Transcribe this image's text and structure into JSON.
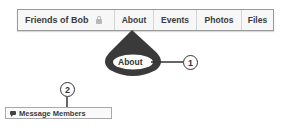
{
  "tabbar": {
    "group_name": "Friends of Bob",
    "group_icon": "lock-icon",
    "tabs": [
      {
        "label": "About"
      },
      {
        "label": "Events"
      },
      {
        "label": "Photos"
      },
      {
        "label": "Files"
      }
    ]
  },
  "callouts": [
    {
      "number": "1",
      "label": "About"
    },
    {
      "number": "2"
    }
  ],
  "message_button": {
    "icon": "speech-bubble-icon",
    "label": "Message Members"
  },
  "colors": {
    "callout_dark": "#3a3a3a",
    "tab_border": "#9a9a9a",
    "tab_text": "#3a3a3a"
  }
}
